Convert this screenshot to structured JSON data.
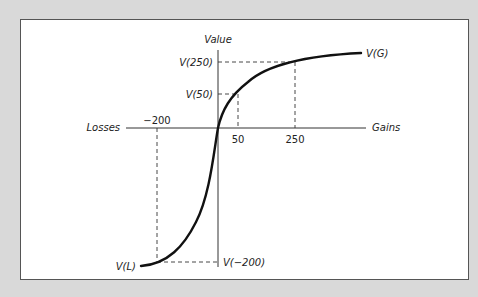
{
  "diagram": {
    "axes": {
      "vertical_label": "Value",
      "left_label": "Losses",
      "right_label": "Gains"
    },
    "x_ticks": [
      {
        "label": "−200",
        "value": -200
      },
      {
        "label": "50",
        "value": 50
      },
      {
        "label": "250",
        "value": 250
      }
    ],
    "y_ticks": [
      {
        "label": "V(250)"
      },
      {
        "label": "V(50)"
      },
      {
        "label": "V(−200)"
      }
    ],
    "curve_labels": {
      "gains": "V(G)",
      "losses": "V(L)"
    },
    "colors": {
      "background": "#d9d9d9",
      "panel": "#ffffff",
      "ink": "#111111",
      "border": "#555555"
    }
  }
}
